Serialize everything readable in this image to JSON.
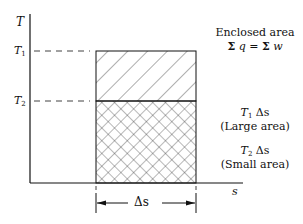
{
  "axes": {
    "y_label": "T",
    "x_label": "s",
    "ticks_y": [
      {
        "symbol": "T",
        "sub": "1"
      },
      {
        "symbol": "T",
        "sub": "2"
      }
    ]
  },
  "annotations": {
    "enclosed_title": "Enclosed area",
    "enclosed_eq_left": "q",
    "enclosed_eq_mid": "=",
    "enclosed_eq_right": "w",
    "sum_symbol": "Σ",
    "large_symbol": "T",
    "large_sub": "1",
    "large_expr": "Δs",
    "large_caption": "(Large area)",
    "small_symbol": "T",
    "small_sub": "2",
    "small_expr": "Δs",
    "small_caption": "(Small area)",
    "width_label": "Δs"
  },
  "colors": {
    "line": "#111111",
    "hatch": "#333333",
    "background": "#ffffff"
  }
}
